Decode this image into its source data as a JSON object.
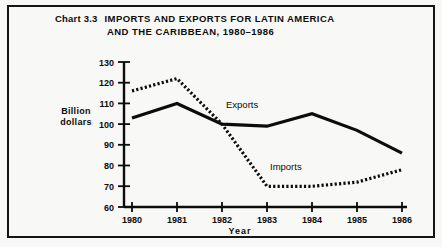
{
  "figure": {
    "chart_number": "Chart 3.3",
    "title_line_1": "IMPORTS AND EXPORTS FOR LATIN AMERICA",
    "title_line_2": "AND THE CARIBBEAN, 1980–1986",
    "frame_color": "#151515",
    "background_color": "#f8f8f6"
  },
  "axes": {
    "y_label_line_1": "Billion",
    "y_label_line_2": "dollars",
    "x_label": "Year"
  },
  "series_labels": {
    "exports": "Exports",
    "imports": "Imports"
  },
  "chart_data": {
    "type": "line",
    "xlabel": "Year",
    "ylabel": "Billion dollars",
    "categories": [
      "1980",
      "1981",
      "1982",
      "1983",
      "1984",
      "1985",
      "1986"
    ],
    "x": [
      1980,
      1981,
      1982,
      1983,
      1984,
      1985,
      1986
    ],
    "xlim": [
      1980,
      1986
    ],
    "ylim": [
      60,
      130
    ],
    "yticks": [
      60,
      70,
      80,
      90,
      100,
      110,
      120,
      130
    ],
    "xticks": [
      "1980",
      "1981",
      "1982",
      "1983",
      "1984",
      "1985",
      "1986"
    ],
    "grid": false,
    "legend": "inline-annotations",
    "series": [
      {
        "name": "Exports",
        "style": "solid",
        "color": "#0c0c0c",
        "values": [
          103,
          110,
          100,
          99,
          105,
          97,
          86
        ]
      },
      {
        "name": "Imports",
        "style": "dotted",
        "color": "#0c0c0c",
        "values": [
          116,
          122,
          100,
          70,
          70,
          72,
          78
        ]
      }
    ],
    "annotations": [
      {
        "text": "Exports",
        "near_x": 1982.6,
        "near_y": 104
      },
      {
        "text": "Imports",
        "near_x": 1984.1,
        "near_y": 76
      }
    ]
  }
}
